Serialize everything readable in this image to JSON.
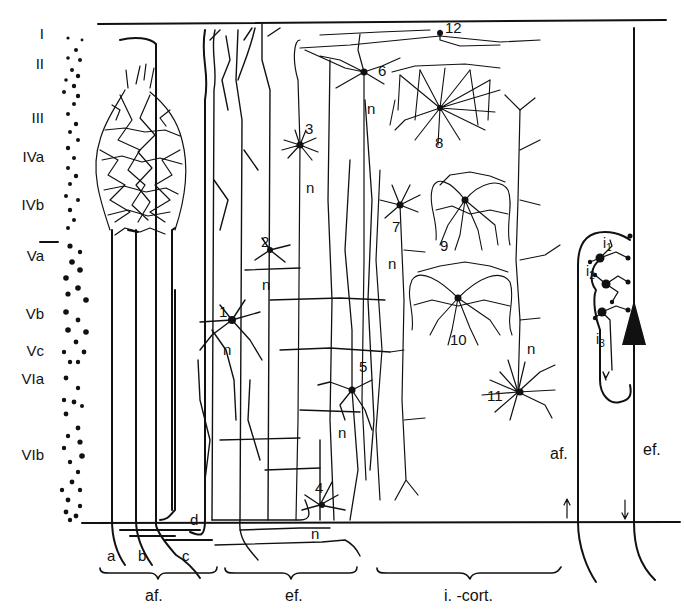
{
  "diagram": {
    "layers": [
      "I",
      "II",
      "III",
      "IVa",
      "IVb",
      "Va",
      "Vb",
      "Vc",
      "VIa",
      "VIb"
    ],
    "neuron_numbers": [
      "1",
      "2",
      "3",
      "4",
      "5",
      "6",
      "7",
      "8",
      "9",
      "10",
      "11",
      "12"
    ],
    "axon_label": "n",
    "fiber_letters": [
      "a",
      "b",
      "c",
      "d"
    ],
    "groups": {
      "afferent": "af.",
      "efferent": "ef.",
      "intracortical": "i. -cort."
    },
    "circuit": {
      "interneurons": [
        "i",
        "i",
        "i"
      ],
      "interneuron_subscripts": [
        "1",
        "2",
        "3"
      ],
      "afferent_label": "af.",
      "efferent_label": "ef."
    },
    "colors": {
      "ink": "#111111",
      "background": "#ffffff"
    }
  }
}
